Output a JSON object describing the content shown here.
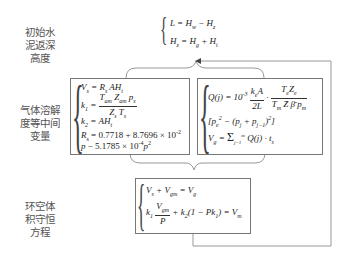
{
  "labels": {
    "top": [
      "初始水",
      "泥返深",
      "高度"
    ],
    "middle": [
      "气体溶解",
      "度等中间",
      "变量"
    ],
    "bottom": [
      "环空体",
      "积守恒",
      "方程"
    ]
  },
  "top_equations": [
    "L = H_w − H_z",
    "H_z = H_g + H_t"
  ],
  "left_box_equations": [
    "V_s = R_s A H_t",
    "k_1 = T_am Z_am p_s / (Z_s T_s)",
    "k_2 = A H_t",
    "R_s = 0.7718 + 8.7696 × 10^-2",
    "p − 5.1785 × 10^-4 p^2"
  ],
  "right_box_equations": [
    "Q(j) = 10^-3 · k_e A / 2L · T_e Z_e / (T_m Z̄ β̄ p_m)",
    "[p_e^2 − (p_j + p_{j−1})^2]",
    "V_g = Σ_{j=1}^{m} Q(j) · t_s"
  ],
  "bottom_box_equations": [
    "V_s + V_gm = V_g",
    "k_1 V_gm / P + k_2 (1 − P k_1) = V_m"
  ],
  "colors": {
    "line": "#888888",
    "box_border": "#777777",
    "text": "#222222",
    "label_text": "#555555"
  }
}
